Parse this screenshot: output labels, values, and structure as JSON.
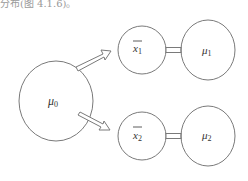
{
  "caption": "分布(图 4.1.6)。",
  "diagram": {
    "population_node": {
      "symbol": "μ",
      "subscript": "0"
    },
    "samples": [
      {
        "sample_symbol": "x",
        "sample_subscript": "1",
        "population_symbol": "μ",
        "population_subscript": "1"
      },
      {
        "sample_symbol": "x",
        "sample_subscript": "2",
        "population_symbol": "μ",
        "population_subscript": "2"
      }
    ],
    "line_color": "#7a7a7a"
  }
}
